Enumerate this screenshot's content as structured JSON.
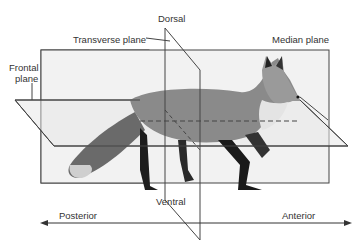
{
  "diagram": {
    "labels": {
      "dorsal": "Dorsal",
      "transverse": "Transverse plane",
      "median": "Median plane",
      "frontal_line1": "Frontal",
      "frontal_line2": "plane",
      "ventral": "Ventral",
      "posterior": "Posterior",
      "anterior": "Anterior"
    }
  }
}
